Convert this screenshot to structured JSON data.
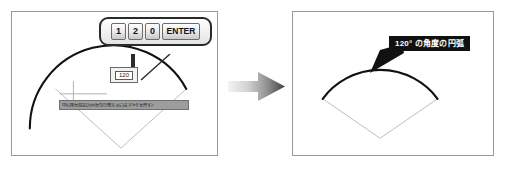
{
  "figure": {
    "background_color": "#ffffff",
    "panel_border_color": "#9a9a9a"
  },
  "panels": {
    "before": {
      "name": "before-state",
      "keypad": {
        "name": "keypad-callout",
        "keys": [
          {
            "label": "1",
            "name": "key-1"
          },
          {
            "label": "2",
            "name": "key-2"
          },
          {
            "label": "0",
            "name": "key-0"
          },
          {
            "label": "ENTER",
            "name": "key-enter"
          }
        ]
      },
      "value_box": {
        "name": "angle-input",
        "value": "120"
      },
      "tooltip": {
        "name": "command-prompt",
        "text": "中心角を指定(方向を切り替えるには [Ctrl] を押す):",
        "background_color": "#9d9d9d"
      },
      "geometry": {
        "arc_color": "#111111",
        "construction_color": "#b0b0b0",
        "crosshair_color": "#a8a8a8"
      }
    },
    "after": {
      "name": "after-state",
      "annotation": {
        "name": "angle-annotation",
        "text": "120° の角度の円弧",
        "background_color": "#111111",
        "text_color": "#ffffff"
      },
      "geometry": {
        "arc_color": "#111111",
        "construction_color": "#b0b0b0",
        "arc_sweep_degrees": 120
      }
    }
  },
  "transition": {
    "name": "transition-arrow",
    "direction": "right",
    "gradient_from": "#f0f0f0",
    "gradient_to": "#4a4a4a"
  }
}
